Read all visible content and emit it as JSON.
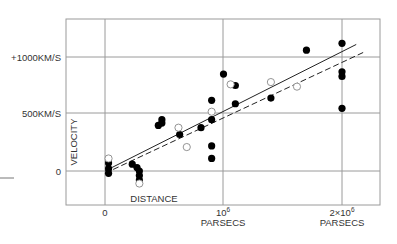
{
  "chart_data": {
    "type": "scatter",
    "title": "",
    "xlabel": "DISTANCE",
    "ylabel": "VELOCITY",
    "x_unit": "PARSECS",
    "y_unit": "KM/S",
    "xlim": [
      -330000,
      2330000
    ],
    "ylim": [
      -300000,
      1340
    ],
    "x_ticks": [
      {
        "value": 0,
        "label": "0",
        "sublabel": ""
      },
      {
        "value": 1000000,
        "label": "10",
        "exp": "6",
        "sublabel": "PARSECS"
      },
      {
        "value": 2000000,
        "label": "2×10",
        "exp": "6",
        "sublabel": "PARSECS"
      }
    ],
    "y_ticks": [
      {
        "value": 0,
        "label": "0"
      },
      {
        "value": 500,
        "label": "500KM/S"
      },
      {
        "value": 1000,
        "label": "+1000KM/S"
      }
    ],
    "grid": true,
    "legend": null,
    "series": [
      {
        "name": "individual nebulae (filled)",
        "marker": "filled-circle",
        "color": "#000000",
        "points": [
          {
            "x": 30000,
            "y": 70
          },
          {
            "x": 30000,
            "y": 20
          },
          {
            "x": 30000,
            "y": -20
          },
          {
            "x": 230000,
            "y": 60
          },
          {
            "x": 270000,
            "y": 30
          },
          {
            "x": 290000,
            "y": 0
          },
          {
            "x": 290000,
            "y": -40
          },
          {
            "x": 290000,
            "y": -80
          },
          {
            "x": 450000,
            "y": 400
          },
          {
            "x": 480000,
            "y": 420
          },
          {
            "x": 480000,
            "y": 450
          },
          {
            "x": 630000,
            "y": 320
          },
          {
            "x": 810000,
            "y": 380
          },
          {
            "x": 900000,
            "y": 620
          },
          {
            "x": 900000,
            "y": 450
          },
          {
            "x": 900000,
            "y": 220
          },
          {
            "x": 900000,
            "y": 110
          },
          {
            "x": 1000000,
            "y": 850
          },
          {
            "x": 1100000,
            "y": 750
          },
          {
            "x": 1100000,
            "y": 590
          },
          {
            "x": 1400000,
            "y": 640
          },
          {
            "x": 1700000,
            "y": 1060
          },
          {
            "x": 2000000,
            "y": 1120
          },
          {
            "x": 2000000,
            "y": 870
          },
          {
            "x": 2000000,
            "y": 830
          },
          {
            "x": 2000000,
            "y": 550
          }
        ]
      },
      {
        "name": "groups of nebulae (open)",
        "marker": "open-circle",
        "color": "#888888",
        "points": [
          {
            "x": 30000,
            "y": 110
          },
          {
            "x": 290000,
            "y": -110
          },
          {
            "x": 620000,
            "y": 380
          },
          {
            "x": 690000,
            "y": 210
          },
          {
            "x": 900000,
            "y": 520
          },
          {
            "x": 1060000,
            "y": 760
          },
          {
            "x": 1400000,
            "y": 780
          },
          {
            "x": 1620000,
            "y": 740
          }
        ]
      }
    ],
    "fit_lines": [
      {
        "name": "solid fit",
        "style": "solid",
        "from": {
          "x": 0,
          "y": 0
        },
        "to": {
          "x": 2120000,
          "y": 1110
        }
      },
      {
        "name": "dashed fit",
        "style": "dashed",
        "from": {
          "x": 0,
          "y": -20
        },
        "to": {
          "x": 2200000,
          "y": 1050
        }
      }
    ]
  },
  "labels": {
    "y_1000": "+1000KM/S",
    "y_500": "500KM/S",
    "y_0": "0",
    "x_0": "0",
    "x_1e6_base": "10",
    "x_1e6_exp": "6",
    "x_1e6_unit": "PARSECS",
    "x_2e6_base": "2×10",
    "x_2e6_exp": "6",
    "x_2e6_unit": "PARSECS",
    "xlabel": "DISTANCE",
    "ylabel": "VELOCITY"
  },
  "layout": {
    "frame": {
      "left": 66,
      "top": 19,
      "right": 380,
      "bottom": 205
    },
    "x0_px": 105,
    "x_px_per_unit": 0.0001185,
    "y0_px": 171,
    "y_px_per_unit": 0.114,
    "grid_color": "#9a9a9a",
    "line_color": "#222222"
  }
}
